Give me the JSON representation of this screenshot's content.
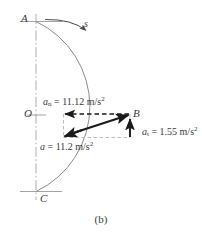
{
  "figure": {
    "caption": "(b)",
    "points": {
      "A": "A",
      "B": "B",
      "C": "C",
      "O": "O"
    },
    "path_label": "s",
    "annotations": {
      "normal": {
        "symbol": "a",
        "subscript": "n",
        "equals": "=",
        "value": "11.12",
        "unit": "m/s",
        "unit_exponent": "2",
        "full": "a_n  =  11.12 m/s^2"
      },
      "tangential": {
        "symbol": "a",
        "subscript": "t",
        "equals": "=",
        "value": "1.55",
        "unit": "m/s",
        "unit_exponent": "2",
        "full": "a_t  =  1.55 m/s^2"
      },
      "resultant": {
        "symbol": "a",
        "subscript": "",
        "equals": "=",
        "value": "11.2",
        "unit": "m/s",
        "unit_exponent": "2",
        "full": "a  =  11.2 m/s^2"
      }
    },
    "colors": {
      "ink": "#3a3a3a",
      "arc": "#8c8c8c",
      "axis": "#9a9a9a",
      "dashed": "#b0b0b0",
      "vector": "#1a1a1a"
    },
    "geometry": {
      "center_x": 36,
      "center_y": 115,
      "radius_px": 94,
      "point_B_x": 130,
      "point_B_y": 114,
      "vector_tail_x": 63,
      "vector_tail_y": 137
    }
  }
}
